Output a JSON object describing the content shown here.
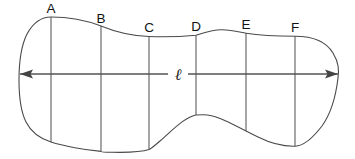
{
  "figure": {
    "background_color": "#ffffff",
    "outline_color": "#4a4a4a",
    "ordinate_color": "#555555",
    "axis_color": "#555555",
    "label_color": "#111111",
    "width": 355,
    "height": 159
  },
  "axis": {
    "label": "ℓ",
    "label_x": 178,
    "label_y": 80,
    "y": 74,
    "x_start": 20,
    "x_end": 338,
    "left_arrow": "arrow-left",
    "right_arrow": "arrow-right"
  },
  "ordinates": [
    {
      "label": "A",
      "x": 51,
      "top_y": 17,
      "bottom_y": 142,
      "label_x": 51,
      "label_y": 13
    },
    {
      "label": "B",
      "x": 101,
      "top_y": 26,
      "bottom_y": 151,
      "label_x": 101,
      "label_y": 23
    },
    {
      "label": "C",
      "x": 149,
      "top_y": 36,
      "bottom_y": 150,
      "label_x": 149,
      "label_y": 32
    },
    {
      "label": "D",
      "x": 196,
      "top_y": 35,
      "bottom_y": 115,
      "label_x": 196,
      "label_y": 31
    },
    {
      "label": "E",
      "x": 246,
      "top_y": 33,
      "bottom_y": 131,
      "label_x": 246,
      "label_y": 29
    },
    {
      "label": "F",
      "x": 295,
      "top_y": 36,
      "bottom_y": 146,
      "label_x": 295,
      "label_y": 32
    }
  ],
  "outline": {
    "path": "M 51 17 C 70 17, 88 21, 101 26 C 118 33, 134 36, 149 36.5 C 165 37, 182 36.5, 196 35.2 C 208 31.5, 215 29.5, 222 29.8 C 232 30.2, 239 32, 246 33.2 C 262 35.8, 280 36.2, 295 36.2 C 312 36.2, 326 41, 333 53 C 339 63, 339 70, 338 78 C 336 95, 332 112, 322 126 C 312 139, 303 146, 295 146.2 C 283 146.5, 270 143, 258 137 C 249 132.5, 247 131.5, 246 131 C 232 124, 217 114.6, 203 114.8 C 198 114.8, 197 114.9, 196 115 C 183 118, 172 131, 160 141 C 156 144.5, 152 148, 149 149.6 C 142 152, 126 152.6, 112 152.3 C 104 152.1, 101 151.6, 101 151.4 C 86 150, 63 146, 51 142 C 40 138.5, 31 132, 26 122 C 20 110, 19 96, 19 80 C 19 62, 21 46, 27 34 C 33 23, 41 17, 51 17 Z"
  },
  "arrow_heads": {
    "left": "M 20 74 L 33 69.5 L 30.5 74 L 33 78.5 Z",
    "right": "M 338 74 L 325 69.5 L 327.5 74 L 325 78.5 Z"
  }
}
